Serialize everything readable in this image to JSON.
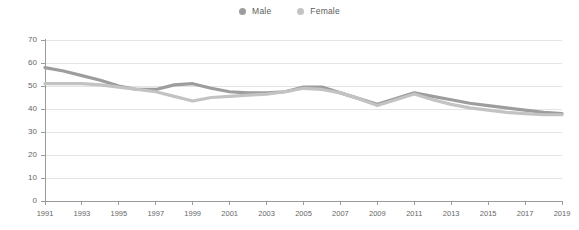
{
  "legend": {
    "position": "top-center",
    "items": [
      {
        "label": "Male",
        "color": "#9d9d9d",
        "icon": "legend-dot-icon"
      },
      {
        "label": "Female",
        "color": "#c3c3c3",
        "icon": "legend-dot-icon"
      }
    ]
  },
  "chart_data": {
    "type": "line",
    "title": "",
    "subtitle": "",
    "xlabel": "",
    "ylabel": "",
    "grid": "horizontal",
    "legend_position": "top-center",
    "x": [
      1991,
      1992,
      1993,
      1994,
      1995,
      1996,
      1997,
      1998,
      1999,
      2000,
      2001,
      2002,
      2003,
      2004,
      2005,
      2006,
      2007,
      2008,
      2009,
      2010,
      2011,
      2012,
      2013,
      2014,
      2015,
      2016,
      2017,
      2018,
      2019
    ],
    "xticks": [
      1991,
      1993,
      1995,
      1997,
      1999,
      2001,
      2003,
      2005,
      2007,
      2009,
      2011,
      2013,
      2015,
      2017,
      2019
    ],
    "xtick_labels": [
      "1991",
      "1993",
      "1995",
      "1997",
      "1999",
      "2001",
      "2003",
      "2005",
      "2007",
      "2009",
      "2011",
      "2013",
      "2015",
      "2017",
      "2019"
    ],
    "xlim": [
      1991,
      2019
    ],
    "yticks": [
      0,
      10,
      20,
      30,
      40,
      50,
      60,
      70
    ],
    "ytick_labels": [
      "0",
      "10",
      "20",
      "30",
      "40",
      "50",
      "60",
      "70"
    ],
    "ylim": [
      0,
      70
    ],
    "series": [
      {
        "name": "Male",
        "color": "#9d9d9d",
        "values": [
          58.0,
          56.5,
          54.5,
          52.5,
          50.0,
          48.5,
          48.5,
          50.5,
          51.0,
          49.0,
          47.5,
          47.0,
          47.0,
          47.5,
          49.5,
          49.5,
          47.0,
          44.5,
          42.0,
          44.5,
          47.0,
          45.5,
          44.0,
          42.5,
          41.5,
          40.5,
          39.5,
          38.5,
          38.0
        ]
      },
      {
        "name": "Female",
        "color": "#c3c3c3",
        "values": [
          51.0,
          51.0,
          51.0,
          50.5,
          49.5,
          48.5,
          47.5,
          45.5,
          43.5,
          45.0,
          45.5,
          46.0,
          46.5,
          47.5,
          49.0,
          48.5,
          47.0,
          44.5,
          41.5,
          44.0,
          46.5,
          44.0,
          42.0,
          40.5,
          39.5,
          38.5,
          38.0,
          37.5,
          37.5
        ]
      }
    ]
  }
}
